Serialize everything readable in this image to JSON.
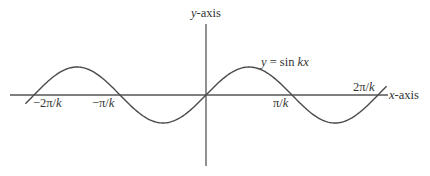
{
  "figure": {
    "equation_label": {
      "y": "y",
      "eq": " = sin ",
      "kx": "kx"
    },
    "y_axis_label": {
      "var": "y",
      "suffix": "-axis"
    },
    "x_axis_label": {
      "var": "x",
      "suffix": "-axis"
    },
    "tick_labels": [
      {
        "text_pre": "−2π/",
        "k": "k"
      },
      {
        "text_pre": "−π/",
        "k": "k"
      },
      {
        "text_pre": "π/",
        "k": "k"
      },
      {
        "text_pre": "2π/",
        "k": "k"
      }
    ],
    "colors": {
      "axis": "#555555",
      "curve": "#4a4a4a",
      "text": "#333333",
      "background": "#ffffff"
    }
  },
  "chart_data": {
    "type": "line",
    "title": "y = sin kx",
    "xlabel": "x-axis",
    "ylabel": "y-axis",
    "x_ticks": [
      "-2π/k",
      "-π/k",
      "π/k",
      "2π/k"
    ],
    "function": "sin(kx)",
    "x_range_periods": [
      -1.05,
      1.05
    ],
    "ylim": [
      -1,
      1
    ],
    "grid": false,
    "legend": "none"
  }
}
